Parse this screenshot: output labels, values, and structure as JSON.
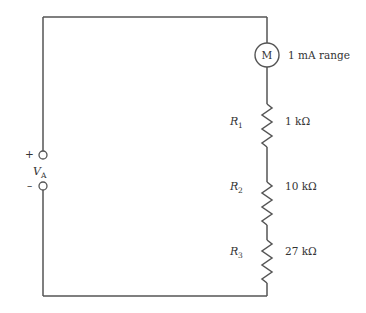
{
  "diagram": {
    "type": "series circuit",
    "source": {
      "label": "V",
      "subscript": "A",
      "plus_sign": "+",
      "minus_sign": "–"
    },
    "meter": {
      "symbol": "M",
      "label": "1 mA range"
    },
    "resistors": [
      {
        "name": "R",
        "subscript": "1",
        "value": "1 kΩ"
      },
      {
        "name": "R",
        "subscript": "2",
        "value": "10 kΩ"
      },
      {
        "name": "R",
        "subscript": "3",
        "value": "27 kΩ"
      }
    ],
    "colors": {
      "wire": "#555555",
      "text": "#333333",
      "background": "#ffffff"
    }
  }
}
